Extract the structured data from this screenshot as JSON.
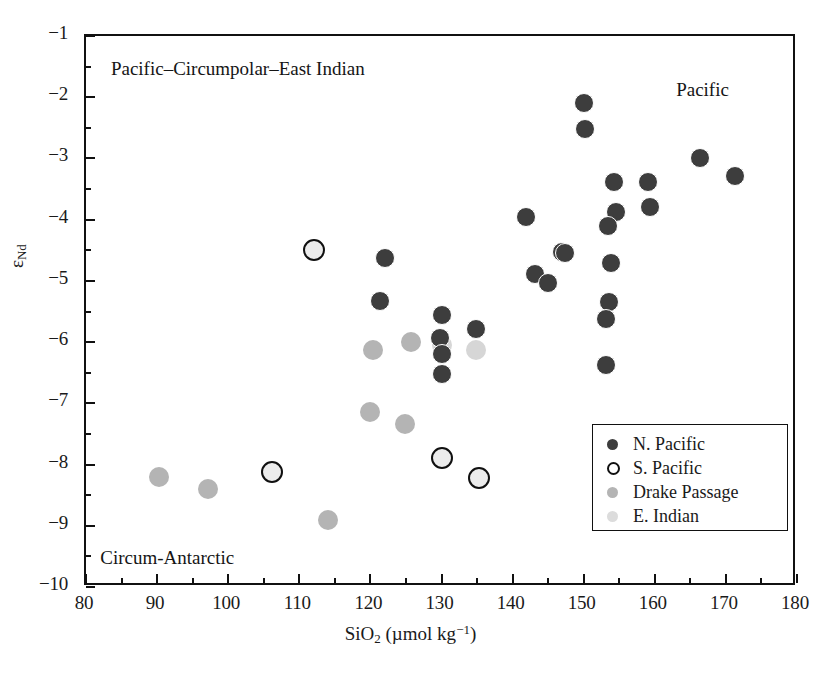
{
  "chart_data": {
    "type": "scatter",
    "title": "",
    "xlabel": "SiO2 (µmol kg-1)",
    "xlabel_base": "SiO",
    "xlabel_sub": "2",
    "xlabel_unit_open": " (µmol kg",
    "xlabel_unit_sup": "−1",
    "xlabel_unit_close": ")",
    "ylabel": "εNd",
    "ylabel_base": "ε",
    "ylabel_sub": "Nd",
    "xlim": [
      80,
      180
    ],
    "ylim": [
      -10,
      -1
    ],
    "xticks": [
      80,
      90,
      100,
      110,
      120,
      130,
      140,
      150,
      160,
      170,
      180
    ],
    "xtick_labels": [
      "80",
      "90",
      "100",
      "110",
      "120",
      "130",
      "140",
      "150",
      "160",
      "170",
      "180"
    ],
    "xminor_step": 5,
    "yticks": [
      -1,
      -2,
      -3,
      -4,
      -5,
      -6,
      -7,
      -8,
      -9,
      -10
    ],
    "ytick_labels": [
      "−1",
      "−2",
      "−3",
      "−4",
      "−5",
      "−6",
      "−7",
      "−8",
      "−9",
      "−10"
    ],
    "yminor_step": 0.5,
    "grid": false,
    "legend_position": "lower-right",
    "series": [
      {
        "name": "N. Pacific",
        "marker": "filled-circle",
        "color": "#3d3d3d",
        "points": [
          [
            150.0,
            -2.1
          ],
          [
            150.2,
            -2.52
          ],
          [
            166.3,
            -3.0
          ],
          [
            171.3,
            -3.28
          ],
          [
            154.2,
            -3.38
          ],
          [
            159.0,
            -3.38
          ],
          [
            159.3,
            -3.79
          ],
          [
            154.5,
            -3.88
          ],
          [
            153.4,
            -4.1
          ],
          [
            141.9,
            -3.95
          ],
          [
            122.0,
            -4.62
          ],
          [
            147.0,
            -4.52
          ],
          [
            147.4,
            -4.55
          ],
          [
            153.9,
            -4.7
          ],
          [
            143.2,
            -4.88
          ],
          [
            145.0,
            -5.03
          ],
          [
            121.4,
            -5.33
          ],
          [
            153.5,
            -5.35
          ],
          [
            130.0,
            -5.55
          ],
          [
            153.2,
            -5.63
          ],
          [
            134.8,
            -5.78
          ],
          [
            129.8,
            -5.93
          ],
          [
            130.0,
            -6.2
          ],
          [
            153.2,
            -6.38
          ],
          [
            130.1,
            -6.52
          ]
        ]
      },
      {
        "name": "S. Pacific",
        "marker": "open-circle",
        "color": "#ececec",
        "points": [
          [
            112.0,
            -4.5
          ],
          [
            106.2,
            -8.12
          ],
          [
            130.1,
            -7.9
          ],
          [
            135.3,
            -8.22
          ]
        ]
      },
      {
        "name": "Drake Passage",
        "marker": "filled-circle",
        "color": "#b4b4b4",
        "points": [
          [
            120.3,
            -6.13
          ],
          [
            125.7,
            -6.0
          ],
          [
            120.0,
            -7.14
          ],
          [
            124.8,
            -7.33
          ],
          [
            90.3,
            -8.2
          ],
          [
            97.2,
            -8.4
          ],
          [
            114.0,
            -8.9
          ]
        ]
      },
      {
        "name": "E. Indian",
        "marker": "filled-circle",
        "color": "#dcdcdc",
        "points": [
          [
            130.0,
            -6.05
          ],
          [
            134.9,
            -6.13
          ]
        ]
      }
    ],
    "annotations": [
      {
        "text": "Pacific–Circumpolar–East Indian",
        "x": 83.5,
        "y": -1.55,
        "anchor": "left"
      },
      {
        "text": "Pacific",
        "x": 163.0,
        "y": -1.9,
        "anchor": "left"
      },
      {
        "text": "Circum-Antarctic",
        "x": 82.0,
        "y": -9.55,
        "anchor": "left"
      }
    ]
  },
  "legend": {
    "items": [
      {
        "label": "N. Pacific",
        "marker": "np"
      },
      {
        "label": "S. Pacific",
        "marker": "sp"
      },
      {
        "label": "Drake Passage",
        "marker": "dp"
      },
      {
        "label": "E. Indian",
        "marker": "ei"
      }
    ]
  }
}
